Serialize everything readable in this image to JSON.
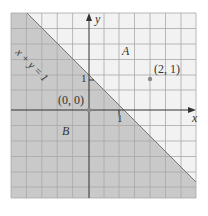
{
  "diagram": {
    "type": "half-plane graph",
    "line_label": "x + y = 1",
    "region_labels": {
      "above": "A",
      "below": "B"
    },
    "axes": {
      "x_label": "x",
      "y_label": "y"
    },
    "ticks": {
      "x_one": "1",
      "y_one": "1"
    },
    "points": [
      {
        "label": "(0, 0)",
        "x": 0,
        "y": 0
      },
      {
        "label": "(2, 1)",
        "x": 2,
        "y": 1
      }
    ],
    "colors": {
      "shaded_region": "#c9c9c9",
      "unshaded_region": "#f2f2f2",
      "grid": "#9a9a9a",
      "axis": "#333333",
      "point": "#8a8a8a"
    }
  }
}
